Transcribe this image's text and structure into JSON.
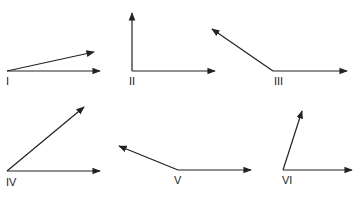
{
  "diagram": {
    "title": "",
    "stroke_color": "#222222",
    "background": "#ffffff",
    "angles": [
      {
        "label": "I",
        "vertex": [
          7,
          71
        ],
        "ray_a": [
          100,
          71
        ],
        "ray_b": [
          94,
          52
        ],
        "label_pos": [
          6,
          85
        ]
      },
      {
        "label": "II",
        "vertex": [
          132,
          71
        ],
        "ray_a": [
          215,
          71
        ],
        "ray_b": [
          132,
          13
        ],
        "label_pos": [
          129,
          85
        ]
      },
      {
        "label": "III",
        "vertex": [
          273,
          71
        ],
        "ray_a": [
          347,
          71
        ],
        "ray_b": [
          212,
          29
        ],
        "label_pos": [
          274,
          85
        ]
      },
      {
        "label": "IV",
        "vertex": [
          7,
          171
        ],
        "ray_a": [
          100,
          171
        ],
        "ray_b": [
          84,
          107
        ],
        "label_pos": [
          6,
          186
        ]
      },
      {
        "label": "V",
        "vertex": [
          178,
          170
        ],
        "ray_a": [
          251,
          170
        ],
        "ray_b": [
          119,
          146
        ],
        "label_pos": [
          174,
          184
        ]
      },
      {
        "label": "VI",
        "vertex": [
          283,
          170
        ],
        "ray_a": [
          352,
          170
        ],
        "ray_b": [
          302,
          111
        ],
        "label_pos": [
          282,
          184
        ]
      }
    ]
  }
}
